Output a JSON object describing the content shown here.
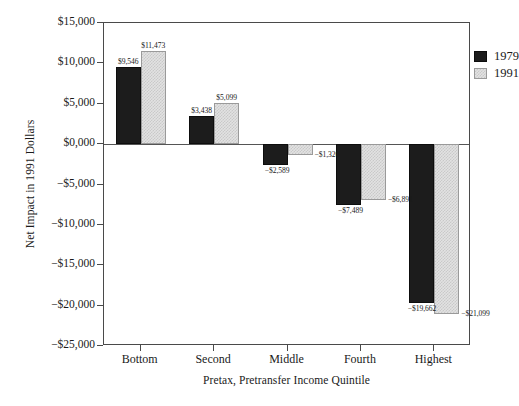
{
  "chart_data": {
    "type": "bar",
    "title": "",
    "xlabel": "Pretax, Pretransfer Income Quintile",
    "ylabel": "Net Impact in 1991 Dollars",
    "categories": [
      "Bottom",
      "Second",
      "Middle",
      "Fourth",
      "Highest"
    ],
    "series": [
      {
        "name": "1979",
        "color": "#1c1c1c",
        "values": [
          9546,
          3438,
          -2589,
          -7489,
          -19662
        ],
        "labels": [
          "$9,546",
          "$3,438",
          "−$2,589",
          "−$7,489",
          "−$19,662"
        ]
      },
      {
        "name": "1991",
        "color": "#e2e2e2",
        "values": [
          11473,
          5099,
          -1320,
          -6891,
          -21099
        ],
        "labels": [
          "$11,473",
          "$5,099",
          "−$1,320",
          "−$6,891",
          "−$21,099"
        ]
      }
    ],
    "ylim": [
      -25000,
      15000
    ],
    "yticks": [
      15000,
      10000,
      5000,
      0,
      -5000,
      -10000,
      -15000,
      -20000,
      -25000
    ],
    "ytick_labels": [
      "$15,000",
      "$10,000",
      "$5,000",
      "$0,000",
      "−$5,000",
      "−$10,000",
      "−$15,000",
      "−$20,000",
      "−$25,000"
    ],
    "grid": false,
    "legend_position": "top-right",
    "zero_line": true
  },
  "legend": {
    "entries": [
      {
        "label": "1979",
        "swatch": "black-solid"
      },
      {
        "label": "1991",
        "swatch": "gray-stipple"
      }
    ]
  }
}
